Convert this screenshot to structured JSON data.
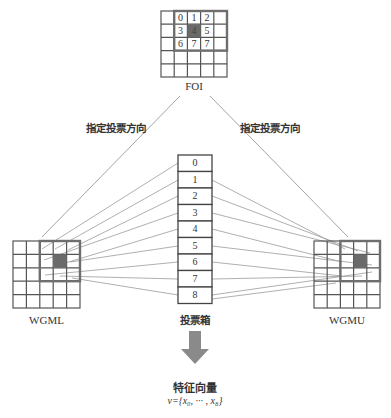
{
  "labels": {
    "foi": "FOI",
    "direction_left": "指定投票方向",
    "direction_right": "指定投票方向",
    "wgml": "WGML",
    "wgmu": "WGMU",
    "vote_box": "投票箱",
    "feature_vector": "特征向量",
    "feature_formula": "v={x₀, ··· , x₈}"
  },
  "foi_neighborhood": {
    "values": [
      [
        "0",
        "1",
        "2"
      ],
      [
        "3",
        "4",
        "5"
      ],
      [
        "6",
        "7",
        "7"
      ]
    ],
    "center_value": "4"
  },
  "vote_bins": [
    "0",
    "1",
    "2",
    "3",
    "4",
    "5",
    "6",
    "7",
    "8"
  ],
  "colors": {
    "grid_line": "#555555",
    "highlight_border": "#6e6e6e",
    "center_fill": "#6a6a6a",
    "arrow_line": "#9a9a9a",
    "big_arrow": "#8a8a8a"
  }
}
